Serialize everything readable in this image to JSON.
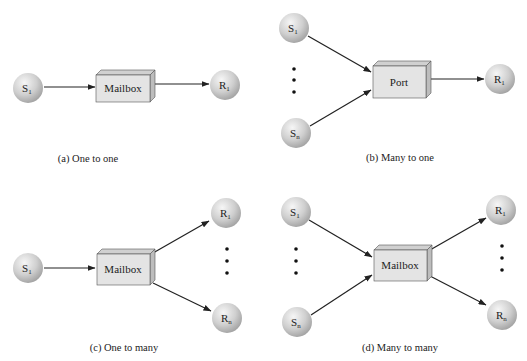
{
  "diagram": {
    "panels": [
      {
        "id": "a",
        "caption": "(a) One to one",
        "box_label": "Mailbox",
        "senders": [
          {
            "label": "S",
            "sub": "1"
          }
        ],
        "receivers": [
          {
            "label": "R",
            "sub": "1"
          }
        ]
      },
      {
        "id": "b",
        "caption": "(b) Many to one",
        "box_label": "Port",
        "senders": [
          {
            "label": "S",
            "sub": "1"
          },
          {
            "label": "S",
            "sub": "n"
          }
        ],
        "receivers": [
          {
            "label": "R",
            "sub": "1"
          }
        ]
      },
      {
        "id": "c",
        "caption": "(c) One to many",
        "box_label": "Mailbox",
        "senders": [
          {
            "label": "S",
            "sub": "1"
          }
        ],
        "receivers": [
          {
            "label": "R",
            "sub": "1"
          },
          {
            "label": "R",
            "sub": "n"
          }
        ]
      },
      {
        "id": "d",
        "caption": "(d) Many to many",
        "box_label": "Mailbox",
        "senders": [
          {
            "label": "S",
            "sub": "1"
          },
          {
            "label": "S",
            "sub": "n"
          }
        ],
        "receivers": [
          {
            "label": "R",
            "sub": "1"
          },
          {
            "label": "R",
            "sub": "n"
          }
        ]
      }
    ],
    "colors": {
      "sphere_light": "#f4f4f4",
      "sphere_dark": "#a8a8a8",
      "box_front": "#e4e4e4",
      "box_top": "#d0d0d0",
      "box_side": "#bdbdbd",
      "stroke": "#333333"
    }
  }
}
